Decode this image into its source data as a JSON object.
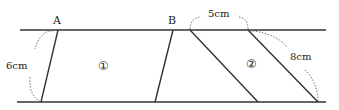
{
  "diagram": {
    "labels": {
      "point_a": "A",
      "point_b": "B",
      "height": "6cm",
      "shape1": "①",
      "top_gap": "5cm",
      "shape2": "②",
      "side": "8cm"
    },
    "colors": {
      "line": "#333333",
      "dashed": "#666666",
      "background": "#ffffff"
    }
  }
}
